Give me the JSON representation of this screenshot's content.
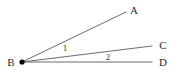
{
  "figure": {
    "type": "angle-diagram",
    "width": 182,
    "height": 77,
    "background_color": "#ffffff",
    "line_color": "#6b6b6b",
    "vertex_color": "#000000",
    "label_color": "#2b2b2b"
  },
  "points": {
    "vertex": {
      "name": "B",
      "label": "B",
      "x": 22,
      "y": 62,
      "label_x": 11,
      "label_y": 62,
      "dot": true
    },
    "a": {
      "name": "A",
      "label": "A",
      "x": 126,
      "y": 12,
      "label_x": 134,
      "label_y": 10
    },
    "c": {
      "name": "C",
      "label": "C",
      "x": 152,
      "y": 46,
      "label_x": 163,
      "label_y": 45
    },
    "d": {
      "name": "D",
      "label": "D",
      "x": 152,
      "y": 62,
      "label_x": 163,
      "label_y": 62
    }
  },
  "rays": [
    {
      "name": "ray-ba",
      "from": "B",
      "to": "A",
      "x1": 22,
      "y1": 62,
      "x2": 126,
      "y2": 12
    },
    {
      "name": "ray-bc",
      "from": "B",
      "to": "C",
      "x1": 22,
      "y1": 62,
      "x2": 152,
      "y2": 46
    },
    {
      "name": "ray-bd",
      "from": "B",
      "to": "D",
      "x1": 22,
      "y1": 62,
      "x2": 152,
      "y2": 62
    }
  ],
  "angle_labels": [
    {
      "name": "angle-1",
      "label": "1",
      "between": "BA and BC",
      "x": 65,
      "y": 48
    },
    {
      "name": "angle-2",
      "label": "2",
      "between": "BC and BD",
      "x": 108,
      "y": 57
    }
  ]
}
